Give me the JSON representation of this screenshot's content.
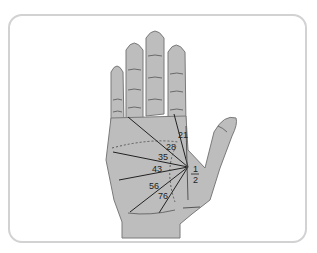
{
  "diagram": {
    "type": "palm-age-chart",
    "colors": {
      "palm_fill": "#bdbdbd",
      "outline": "#6e6e6e",
      "line": "#222222",
      "frame": "#d2d2d2"
    },
    "age_labels": [
      {
        "id": "age-21",
        "text": "21"
      },
      {
        "id": "age-28",
        "text": "28"
      },
      {
        "id": "age-35",
        "text": "35"
      },
      {
        "id": "age-43",
        "text": "43"
      },
      {
        "id": "age-56",
        "text": "56"
      },
      {
        "id": "age-76",
        "text": "76"
      }
    ],
    "fraction": {
      "numerator": "1",
      "denominator": "2"
    }
  }
}
